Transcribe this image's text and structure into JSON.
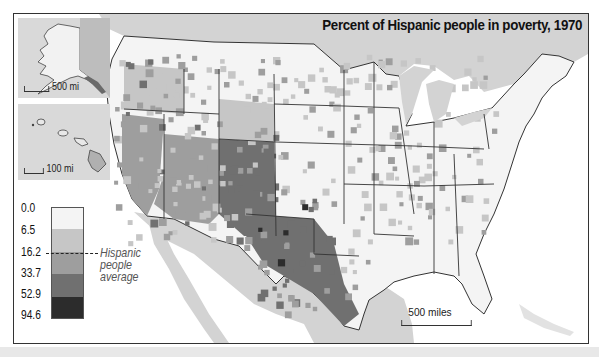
{
  "map": {
    "title": "Percent of Hispanic people in poverty, 1970",
    "subject": "Hispanic people in poverty by US county",
    "year": "1970",
    "main_scale_label": "500 miles",
    "colors": {
      "background_land_foreign": "#d3d3d3",
      "water": "#ffffff",
      "state_border": "#333333"
    }
  },
  "insets": {
    "alaska": {
      "name": "Alaska",
      "scale_label": "500 mi"
    },
    "hawaii": {
      "name": "Hawaii",
      "scale_label": "100 mi"
    }
  },
  "legend": {
    "breaks": [
      "0.0",
      "6.5",
      "16.2",
      "33.7",
      "52.9",
      "94.6"
    ],
    "classes": [
      {
        "range": "0.0–6.5",
        "color": "#f4f4f4"
      },
      {
        "range": "6.5–16.2",
        "color": "#c6c6c6"
      },
      {
        "range": "16.2–33.7",
        "color": "#9e9e9e"
      },
      {
        "range": "33.7–52.9",
        "color": "#707070"
      },
      {
        "range": "52.9–94.6",
        "color": "#2c2c2c"
      }
    ],
    "average_marker_value": "16.2",
    "average_label_lines": [
      "Hispanic",
      "people",
      "average"
    ]
  }
}
